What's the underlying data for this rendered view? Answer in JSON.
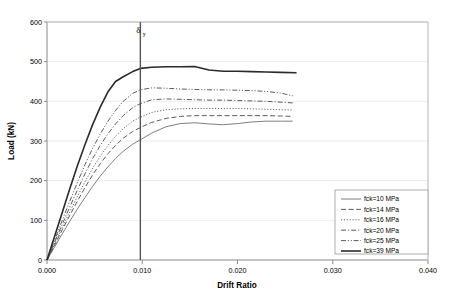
{
  "chart_data": {
    "type": "line",
    "title": "",
    "xlabel": "Drift Ratio",
    "ylabel": "Load (kN)",
    "xlim": [
      0.0,
      0.04
    ],
    "ylim": [
      0,
      600
    ],
    "xticks": [
      "0.000",
      "0.010",
      "0.020",
      "0.030",
      "0.040"
    ],
    "xtick_values": [
      0.0,
      0.01,
      0.02,
      0.03,
      0.04
    ],
    "yticks": [
      "0",
      "100",
      "200",
      "300",
      "400",
      "500",
      "600"
    ],
    "ytick_values": [
      0,
      100,
      200,
      300,
      400,
      500,
      600
    ],
    "grid": "horizontal-only",
    "legend_position": "lower-right-inside",
    "annotations": [
      {
        "name": "yield-drift-marker",
        "symbol": "δ",
        "subscript": "y",
        "x_value": 0.0098,
        "type": "vertical-line"
      }
    ],
    "series": [
      {
        "name": "fck=10 MPa",
        "label": "fck=10 MPa",
        "style": "solid-thin",
        "color": "#6f6f6f",
        "x": [
          0.0,
          0.0008,
          0.0016,
          0.0024,
          0.0032,
          0.004,
          0.0048,
          0.0056,
          0.0064,
          0.0072,
          0.008,
          0.009,
          0.0098,
          0.011,
          0.0125,
          0.014,
          0.0155,
          0.017,
          0.0185,
          0.02,
          0.0215,
          0.023,
          0.0245,
          0.0258
        ],
        "y": [
          0,
          33,
          66,
          98,
          129,
          158,
          186,
          212,
          235,
          256,
          274,
          292,
          303,
          320,
          336,
          344,
          346,
          343,
          341,
          344,
          348,
          350,
          350,
          350
        ]
      },
      {
        "name": "fck=14 MPa",
        "label": "fck=14 MPa",
        "style": "dashed",
        "color": "#4a4a4a",
        "x": [
          0.0,
          0.0008,
          0.0016,
          0.0024,
          0.0032,
          0.004,
          0.0048,
          0.0056,
          0.0064,
          0.0072,
          0.008,
          0.009,
          0.0098,
          0.011,
          0.0125,
          0.014,
          0.0155,
          0.017,
          0.0185,
          0.02,
          0.0215,
          0.023,
          0.0245,
          0.0258
        ],
        "y": [
          0,
          38,
          76,
          113,
          149,
          183,
          215,
          243,
          268,
          289,
          307,
          324,
          334,
          347,
          357,
          362,
          364,
          364,
          364,
          364,
          364,
          364,
          363,
          362
        ]
      },
      {
        "name": "fck=16 MPa",
        "label": "fck=16 MPa",
        "style": "dotted",
        "color": "#4a4a4a",
        "x": [
          0.0,
          0.0008,
          0.0016,
          0.0024,
          0.0032,
          0.004,
          0.0048,
          0.0056,
          0.0064,
          0.0072,
          0.008,
          0.009,
          0.0098,
          0.011,
          0.0125,
          0.014,
          0.0155,
          0.017,
          0.0185,
          0.02,
          0.0215,
          0.023,
          0.0245,
          0.0258
        ],
        "y": [
          0,
          41,
          82,
          122,
          161,
          198,
          232,
          262,
          289,
          312,
          331,
          350,
          360,
          372,
          379,
          381,
          382,
          382,
          382,
          382,
          381,
          380,
          379,
          378
        ]
      },
      {
        "name": "fck=20 MPa",
        "label": "fck=20 MPa",
        "style": "dash-dot",
        "color": "#4a4a4a",
        "x": [
          0.0,
          0.0008,
          0.0016,
          0.0024,
          0.0032,
          0.004,
          0.0048,
          0.0056,
          0.0064,
          0.0072,
          0.008,
          0.009,
          0.0098,
          0.011,
          0.0125,
          0.014,
          0.0155,
          0.017,
          0.0185,
          0.02,
          0.0215,
          0.023,
          0.0245,
          0.0258
        ],
        "y": [
          0,
          45,
          90,
          134,
          177,
          218,
          256,
          289,
          318,
          343,
          364,
          384,
          394,
          404,
          406,
          405,
          404,
          403,
          403,
          402,
          401,
          400,
          398,
          396
        ]
      },
      {
        "name": "fck=25 MPa",
        "label": "fck=25 MPa",
        "style": "dash-dot-dot",
        "color": "#4a4a4a",
        "x": [
          0.0,
          0.0008,
          0.0016,
          0.0024,
          0.0032,
          0.004,
          0.0048,
          0.0056,
          0.0064,
          0.0072,
          0.008,
          0.009,
          0.0098,
          0.011,
          0.0125,
          0.014,
          0.0155,
          0.017,
          0.0185,
          0.02,
          0.0215,
          0.023,
          0.0245,
          0.0258
        ],
        "y": [
          0,
          50,
          100,
          149,
          196,
          241,
          282,
          318,
          350,
          377,
          400,
          420,
          429,
          434,
          433,
          431,
          430,
          429,
          429,
          428,
          427,
          425,
          421,
          414
        ]
      },
      {
        "name": "fck=39 MPa",
        "label": "fck=39 MPa",
        "style": "solid-thick",
        "color": "#2b2b2b",
        "x": [
          0.0,
          0.0008,
          0.0016,
          0.0024,
          0.0032,
          0.004,
          0.0048,
          0.0056,
          0.0064,
          0.0072,
          0.008,
          0.009,
          0.0098,
          0.011,
          0.0125,
          0.014,
          0.0155,
          0.017,
          0.0185,
          0.02,
          0.0215,
          0.023,
          0.0245,
          0.0262
        ],
        "y": [
          0,
          60,
          120,
          180,
          238,
          292,
          342,
          386,
          424,
          450,
          462,
          475,
          483,
          486,
          487,
          487,
          488,
          479,
          476,
          476,
          475,
          474,
          473,
          472
        ]
      }
    ]
  },
  "legend": {
    "entries": [
      {
        "label": "fck=10 MPa"
      },
      {
        "label": "fck=14 MPa"
      },
      {
        "label": "fck=16 MPa"
      },
      {
        "label": "fck=20 MPa"
      },
      {
        "label": "fck=25 MPa"
      },
      {
        "label": "fck=39 MPa"
      }
    ]
  },
  "axes": {
    "x_title": "Drift Ratio",
    "y_title": "Load (kN)"
  }
}
